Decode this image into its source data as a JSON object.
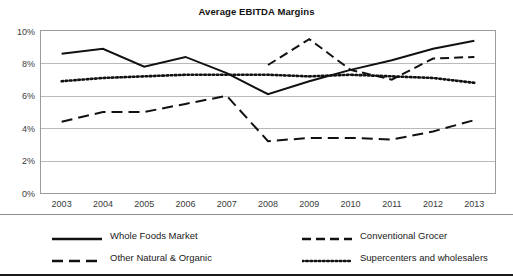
{
  "chart_data": {
    "type": "line",
    "title": "Average EBITDA Margins",
    "xlabel": "",
    "ylabel": "",
    "x": [
      2003,
      2004,
      2005,
      2006,
      2007,
      2008,
      2009,
      2010,
      2011,
      2012,
      2013
    ],
    "categories": [
      "2003",
      "2004",
      "2005",
      "2006",
      "2007",
      "2008",
      "2009",
      "2010",
      "2011",
      "2012",
      "2013"
    ],
    "ylim": [
      0,
      10
    ],
    "yticks": [
      0,
      2,
      4,
      6,
      8,
      10
    ],
    "ytick_labels": [
      "0%",
      "2%",
      "4%",
      "6%",
      "8%",
      "10%"
    ],
    "grid": true,
    "legend_position": "bottom",
    "series": [
      {
        "name": "Whole Foods Market",
        "style": "solid",
        "color": "#111111",
        "values": [
          8.6,
          8.9,
          7.8,
          8.4,
          7.4,
          6.1,
          6.9,
          7.6,
          8.2,
          8.9,
          9.4
        ]
      },
      {
        "name": "Conventional Grocer",
        "style": "dashed",
        "color": "#111111",
        "values": [
          null,
          null,
          null,
          null,
          null,
          7.9,
          9.5,
          7.6,
          7.0,
          8.3,
          8.4
        ]
      },
      {
        "name": "Other Natural & Organic",
        "style": "long-dashed",
        "color": "#111111",
        "values": [
          4.4,
          5.0,
          5.0,
          5.5,
          6.0,
          3.2,
          3.4,
          3.4,
          3.3,
          3.8,
          4.5
        ]
      },
      {
        "name": "Supercenters and wholesalers",
        "style": "dotted",
        "color": "#111111",
        "values": [
          6.9,
          7.1,
          7.2,
          7.3,
          7.3,
          7.3,
          7.2,
          7.3,
          7.2,
          7.1,
          6.8
        ]
      }
    ]
  },
  "legend": {
    "items": [
      {
        "label": "Whole Foods Market",
        "style": "solid"
      },
      {
        "label": "Conventional Grocer",
        "style": "dashed"
      },
      {
        "label": "Other Natural & Organic",
        "style": "long-dashed"
      },
      {
        "label": "Supercenters and wholesalers",
        "style": "dotted"
      }
    ]
  }
}
